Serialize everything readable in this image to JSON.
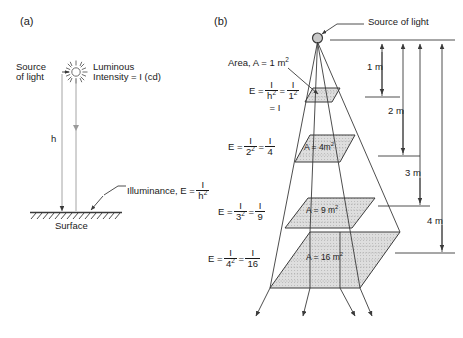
{
  "figure": {
    "background": "#ffffff",
    "line_color": "#3a3a3a",
    "text_color": "#1a1a1a",
    "fill_color": "#d9d9d9"
  },
  "panel_a": {
    "tag": "(a)",
    "source_label_line1": "Source",
    "source_label_line2": "of light",
    "luminous_line1": "Luminous",
    "luminous_line2": "Intensity = I (cd)",
    "height_symbol": "h",
    "illuminance_label": "Illuminance, E =",
    "illuminance_num": "I",
    "illuminance_den": "h",
    "illuminance_den_exp": "2",
    "surface_label": "Surface",
    "sun_icon": "sun-burst-icon"
  },
  "panel_b": {
    "tag": "(b)",
    "source_label": "Source of light",
    "area_callout": "Area, A = 1 m",
    "area_callout_exp": "2",
    "levels": [
      {
        "distance_m": 1,
        "area_text": "A = 1 m",
        "area_exp": "2",
        "area_inside": "",
        "eq_lead": "E =",
        "num1": "I",
        "den1": "h",
        "den1_exp": "2",
        "eq_mid": "=",
        "num2": "I",
        "den2": "1",
        "den2_exp": "2",
        "eq_tail": "= I"
      },
      {
        "distance_m": 2,
        "area_text": "A = 4m",
        "area_exp": "2",
        "area_inside": "A = 4m",
        "eq_lead": "E =",
        "num1": "I",
        "den1": "2",
        "den1_exp": "2",
        "eq_mid": "=",
        "num2": "I",
        "den2": "4",
        "den2_exp": "",
        "eq_tail": ""
      },
      {
        "distance_m": 3,
        "area_text": "A = 9 m",
        "area_exp": "2",
        "area_inside": "A = 9 m",
        "eq_lead": "E =",
        "num1": "I",
        "den1": "3",
        "den1_exp": "2",
        "eq_mid": "=",
        "num2": "I",
        "den2": "9",
        "den2_exp": "",
        "eq_tail": ""
      },
      {
        "distance_m": 4,
        "area_text": "A = 16 m",
        "area_exp": "2",
        "area_inside": "A = 16 m",
        "eq_lead": "E =",
        "num1": "I",
        "den1": "4",
        "den1_exp": "2",
        "eq_mid": "=",
        "num2": "I",
        "den2": "16",
        "den2_exp": "",
        "eq_tail": ""
      }
    ],
    "dimensions": [
      {
        "label": "1 m"
      },
      {
        "label": "2 m"
      },
      {
        "label": "3 m"
      },
      {
        "label": "4 m"
      }
    ]
  }
}
